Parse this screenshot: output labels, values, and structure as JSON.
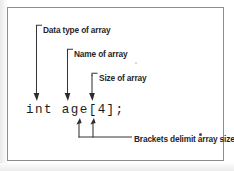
{
  "figure": {
    "kind": "annotated-code-diagram",
    "code": "int age[4];",
    "border_color": "#8d8d8d",
    "ink_color": "#26262a",
    "background_color": "#ffffff"
  },
  "callouts": [
    {
      "id": "data-type",
      "label": "Data type of array",
      "points_at": "int",
      "arrow_direction": "down"
    },
    {
      "id": "name",
      "label": "Name of array",
      "points_at": "age",
      "arrow_direction": "down"
    },
    {
      "id": "size",
      "label": "Size of array",
      "points_at": "4",
      "arrow_direction": "down"
    },
    {
      "id": "brackets",
      "label": "Brackets delimit array size.",
      "points_at": "[ ]",
      "arrow_direction": "up"
    }
  ]
}
